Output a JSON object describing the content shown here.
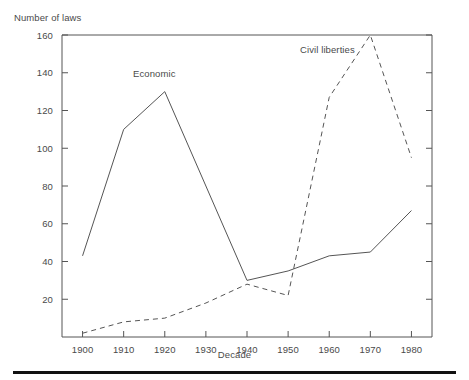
{
  "chart_data": {
    "type": "line",
    "title": "",
    "ylabel": "Number of laws",
    "xlabel": "Decade",
    "categories": [
      1900,
      1910,
      1920,
      1930,
      1940,
      1950,
      1960,
      1970,
      1980
    ],
    "xlim": [
      1895,
      1985
    ],
    "ylim": [
      0,
      160
    ],
    "xticks": [
      "1900",
      "1910",
      "1920",
      "1930",
      "1940",
      "1950",
      "1960",
      "1970",
      "1980"
    ],
    "yticks": [
      "20",
      "40",
      "60",
      "80",
      "100",
      "120",
      "140",
      "160"
    ],
    "grid": false,
    "legend_position": "inline-annotation",
    "series": [
      {
        "name": "Economic",
        "style": "solid",
        "color": "#555555",
        "x": [
          1900,
          1910,
          1920,
          1940,
          1950,
          1960,
          1970,
          1980
        ],
        "values": [
          43,
          110,
          130,
          30,
          35,
          43,
          45,
          67
        ],
        "label_position": {
          "x": 1921,
          "y": 142
        }
      },
      {
        "name": "Civil liberties",
        "style": "dashed",
        "color": "#555555",
        "x": [
          1900,
          1910,
          1920,
          1930,
          1940,
          1950,
          1960,
          1970,
          1980
        ],
        "values": [
          2,
          8,
          10,
          18,
          28,
          22,
          127,
          160,
          95
        ],
        "label_position": {
          "x": 1962,
          "y": 153
        }
      }
    ],
    "annotations": [
      {
        "text": "Economic",
        "x": 1921,
        "y": 142
      },
      {
        "text": "Civil liberties",
        "x": 1962,
        "y": 153
      }
    ]
  }
}
